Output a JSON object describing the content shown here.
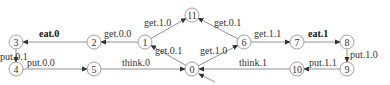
{
  "diagram": {
    "type": "labelled-transition-system",
    "initial_state": "0",
    "nodes": [
      {
        "id": "0",
        "label": "0",
        "x": 192,
        "y": 69
      },
      {
        "id": "1",
        "label": "1",
        "x": 145,
        "y": 42
      },
      {
        "id": "2",
        "label": "2",
        "x": 94,
        "y": 42
      },
      {
        "id": "3",
        "label": "3",
        "x": 16,
        "y": 42
      },
      {
        "id": "4",
        "label": "4",
        "x": 16,
        "y": 69
      },
      {
        "id": "5",
        "label": "5",
        "x": 94,
        "y": 69
      },
      {
        "id": "6",
        "label": "6",
        "x": 244,
        "y": 42
      },
      {
        "id": "7",
        "label": "7",
        "x": 297,
        "y": 42
      },
      {
        "id": "8",
        "label": "8",
        "x": 347,
        "y": 42
      },
      {
        "id": "9",
        "label": "9",
        "x": 347,
        "y": 69
      },
      {
        "id": "10",
        "label": "10",
        "x": 297,
        "y": 69
      },
      {
        "id": "11",
        "label": "11",
        "x": 192,
        "y": 15
      }
    ],
    "edges": [
      {
        "from": "0",
        "to": "1",
        "label": "get.0.1",
        "bold": false,
        "lx": 155,
        "ly": 54
      },
      {
        "from": "1",
        "to": "2",
        "label": "get.0.0",
        "bold": false,
        "lx": 104,
        "ly": 37
      },
      {
        "from": "2",
        "to": "3",
        "label": "eat.0",
        "bold": true,
        "lx": 39,
        "ly": 37
      },
      {
        "from": "3",
        "to": "4",
        "label": "put.0.1",
        "bold": false,
        "lx": 0,
        "ly": 60
      },
      {
        "from": "4",
        "to": "5",
        "label": "put.0.0",
        "bold": false,
        "lx": 27,
        "ly": 66
      },
      {
        "from": "5",
        "to": "0",
        "label": "think.0",
        "bold": false,
        "lx": 122,
        "ly": 66
      },
      {
        "from": "1",
        "to": "11",
        "label": "get.1.0",
        "bold": false,
        "lx": 144,
        "ly": 26
      },
      {
        "from": "6",
        "to": "11",
        "label": "get.0.1",
        "bold": false,
        "lx": 214,
        "ly": 26
      },
      {
        "from": "0",
        "to": "6",
        "label": "get.1.0",
        "bold": false,
        "lx": 200,
        "ly": 54
      },
      {
        "from": "6",
        "to": "7",
        "label": "get.1.1",
        "bold": false,
        "lx": 254,
        "ly": 37
      },
      {
        "from": "7",
        "to": "8",
        "label": "eat.1",
        "bold": true,
        "lx": 308,
        "ly": 37
      },
      {
        "from": "8",
        "to": "9",
        "label": "put.1.0",
        "bold": false,
        "lx": 350,
        "ly": 58
      },
      {
        "from": "9",
        "to": "10",
        "label": "put.1.1",
        "bold": false,
        "lx": 309,
        "ly": 66
      },
      {
        "from": "10",
        "to": "0",
        "label": "think.1",
        "bold": false,
        "lx": 239,
        "ly": 66
      }
    ],
    "initial_arrow": {
      "x1": 215,
      "y1": 82,
      "x2": 199,
      "y2": 74
    }
  }
}
